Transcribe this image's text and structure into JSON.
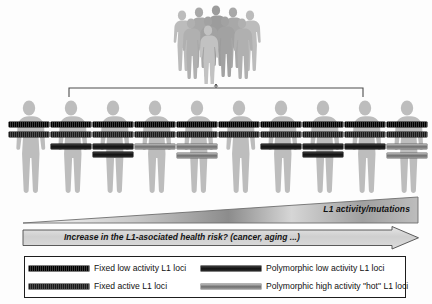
{
  "figure": {
    "crowd": {
      "name": "population-crowd",
      "person_count": 9,
      "color": "#b3b3b3"
    },
    "bracket": {
      "name": "population-bracket",
      "color": "#555555"
    },
    "people_row": {
      "count": 10,
      "body_color": "#bdbdbd",
      "individuals": [
        {
          "index": 1,
          "bars": [
            {
              "type": "fixed-low",
              "top": 24,
              "width": 40,
              "left": 1
            },
            {
              "type": "fixed-active",
              "top": 34,
              "width": 40,
              "left": 1
            }
          ]
        },
        {
          "index": 2,
          "bars": [
            {
              "type": "fixed-low",
              "top": 24,
              "width": 40,
              "left": 1
            },
            {
              "type": "fixed-active",
              "top": 34,
              "width": 40,
              "left": 1
            },
            {
              "type": "poly-low",
              "top": 46,
              "width": 40,
              "left": 1
            }
          ]
        },
        {
          "index": 3,
          "bars": [
            {
              "type": "fixed-low",
              "top": 24,
              "width": 40,
              "left": 1
            },
            {
              "type": "fixed-active",
              "top": 34,
              "width": 40,
              "left": 1
            },
            {
              "type": "poly-low",
              "top": 46,
              "width": 40,
              "left": 1
            },
            {
              "type": "poly-low",
              "top": 54,
              "width": 40,
              "left": 1
            }
          ]
        },
        {
          "index": 4,
          "bars": [
            {
              "type": "fixed-low",
              "top": 24,
              "width": 40,
              "left": 1
            },
            {
              "type": "fixed-active",
              "top": 34,
              "width": 40,
              "left": 1
            },
            {
              "type": "poly-hot",
              "top": 46,
              "width": 40,
              "left": 1
            }
          ]
        },
        {
          "index": 5,
          "bars": [
            {
              "type": "fixed-low",
              "top": 24,
              "width": 40,
              "left": 1
            },
            {
              "type": "fixed-active",
              "top": 34,
              "width": 40,
              "left": 1
            },
            {
              "type": "poly-hot",
              "top": 46,
              "width": 40,
              "left": 1
            },
            {
              "type": "poly-hot",
              "top": 55,
              "width": 40,
              "left": 1
            }
          ]
        },
        {
          "index": 6,
          "bars": [
            {
              "type": "fixed-low",
              "top": 24,
              "width": 40,
              "left": 1
            },
            {
              "type": "fixed-active",
              "top": 34,
              "width": 40,
              "left": 1
            }
          ]
        },
        {
          "index": 7,
          "bars": [
            {
              "type": "fixed-low",
              "top": 24,
              "width": 40,
              "left": 1
            },
            {
              "type": "fixed-active",
              "top": 34,
              "width": 40,
              "left": 1
            },
            {
              "type": "poly-low",
              "top": 46,
              "width": 40,
              "left": 1
            }
          ]
        },
        {
          "index": 8,
          "bars": [
            {
              "type": "fixed-low",
              "top": 24,
              "width": 40,
              "left": 1
            },
            {
              "type": "fixed-active",
              "top": 34,
              "width": 40,
              "left": 1
            },
            {
              "type": "poly-low",
              "top": 46,
              "width": 40,
              "left": 1
            },
            {
              "type": "poly-low",
              "top": 54,
              "width": 40,
              "left": 1
            }
          ]
        },
        {
          "index": 9,
          "bars": [
            {
              "type": "fixed-low",
              "top": 24,
              "width": 40,
              "left": 1
            },
            {
              "type": "fixed-active",
              "top": 34,
              "width": 40,
              "left": 1
            },
            {
              "type": "poly-low",
              "top": 46,
              "width": 40,
              "left": 1
            }
          ]
        },
        {
          "index": 10,
          "bars": [
            {
              "type": "fixed-low",
              "top": 24,
              "width": 40,
              "left": 1
            },
            {
              "type": "fixed-active",
              "top": 34,
              "width": 40,
              "left": 1
            },
            {
              "type": "poly-hot",
              "top": 46,
              "width": 40,
              "left": 1
            },
            {
              "type": "poly-hot",
              "top": 55,
              "width": 40,
              "left": 1
            }
          ]
        }
      ]
    },
    "gradient_triangle": {
      "label": "L1 activity/mutations",
      "direction": "left-to-right increasing",
      "fill_start": "#ffffff",
      "fill_end": "#9a9a9a"
    },
    "risk_arrow": {
      "label": "Increase in the L1-asociated health risk? (cancer, aging ...)",
      "direction": "left-to-right",
      "fill": "#d4d4d4",
      "stroke": "#4a4a4a"
    },
    "legend": {
      "items": [
        {
          "key": "fixed-low",
          "label": "Fixed low activity L1 loci",
          "color": "#1b1b1b"
        },
        {
          "key": "poly-low",
          "label": "Polymorphic low activity L1 loci",
          "color": "#262626"
        },
        {
          "key": "fixed-active",
          "label": "Fixed active L1 loci",
          "color": "#2e2e2e"
        },
        {
          "key": "poly-hot",
          "label": "Polymorphic high activity \"hot\" L1 loci",
          "color": "#8d8d8d"
        }
      ]
    }
  }
}
